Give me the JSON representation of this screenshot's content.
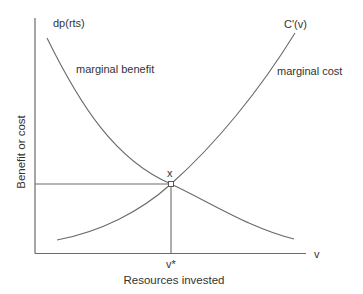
{
  "diagram": {
    "type": "economics-marginal-analysis",
    "colors": {
      "line": "#6a6a6a",
      "text": "#333333",
      "background": "#ffffff"
    },
    "axes": {
      "x_label": "Resources invested",
      "y_label": "Benefit or cost",
      "x_end_label": "v"
    },
    "curves": {
      "marginal_benefit": {
        "function_label": "dp(rts)",
        "description_label": "marginal benefit",
        "shape": "decreasing convex"
      },
      "marginal_cost": {
        "function_label": "C'(v)",
        "description_label": "marginal cost",
        "shape": "increasing convex"
      }
    },
    "equilibrium": {
      "point_label": "x",
      "x_value_label": "v*"
    }
  }
}
